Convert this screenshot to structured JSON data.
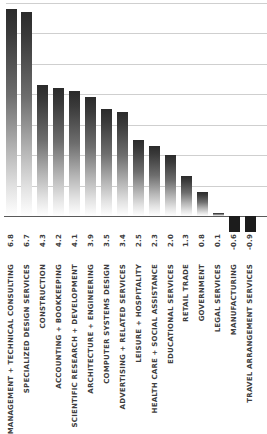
{
  "chart_data": {
    "type": "bar",
    "title": "",
    "subtitle": "",
    "xlabel": "",
    "ylabel": "",
    "grid": true,
    "legend": null,
    "orientation": "vertical",
    "ylim": [
      -1.2,
      7.3
    ],
    "gridline_values": [
      1,
      2,
      3,
      4,
      5,
      6,
      7
    ],
    "zero_line": 0,
    "categories": [
      "MANAGEMENT + TECHNICAL CONSULTING",
      "SPECIALIZED DESIGN SERVICES",
      "CONSTRUCTION",
      "ACCOUNTING + BOOKKEEPING",
      "SCIENTIFIC RESEARCH + DEVELOPMENT",
      "ARCHITECTURE + ENGINEERING",
      "COMPUTER SYSTEMS DESIGN",
      "ADVERTISING + RELATED SERVICES",
      "LEISURE + HOSPITALITY",
      "HEALTH CARE + SOCIAL ASSISTANCE",
      "EDUCATIONAL SERVICES",
      "RETAIL TRADE",
      "GOVERNMENT",
      "LEGAL SERVICES",
      "MANUFACTURING",
      "TRAVEL ARRANGEMENT SERVICES"
    ],
    "values": [
      6.8,
      6.7,
      4.3,
      4.2,
      4.1,
      3.9,
      3.5,
      3.4,
      2.5,
      2.3,
      2.0,
      1.3,
      0.8,
      0.1,
      -0.6,
      -0.9
    ],
    "value_labels": [
      "6.8",
      "6.7",
      "4.3",
      "4.2",
      "4.1",
      "3.9",
      "3.5",
      "3.4",
      "2.5",
      "2.3",
      "2.0",
      "1.3",
      "0.8",
      "0.1",
      "-0.6",
      "-0.9"
    ],
    "colors": {
      "bar_positive_top": "#2b2b2b",
      "bar_positive_bottom": "#ffffff",
      "bar_negative": "#1c1c1c",
      "gridline": "#cfcfcf",
      "zero_line": "#5a5a5a",
      "label_text": "#3d3d3d",
      "background": "#ffffff"
    }
  }
}
